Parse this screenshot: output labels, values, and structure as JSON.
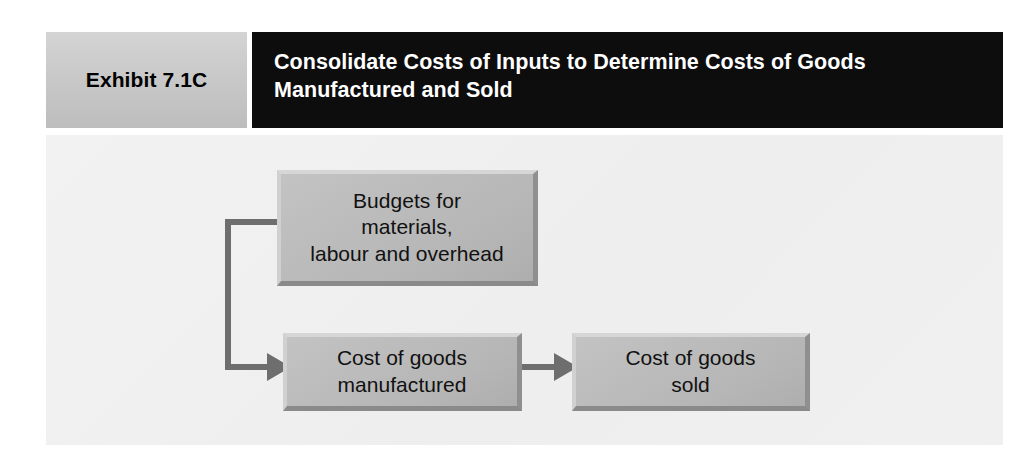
{
  "exhibit": {
    "label": "Exhibit 7.1C",
    "title": "Consolidate Costs of Inputs to Determine Costs of Goods Manufactured and Sold",
    "colors": {
      "label_background": "#c9c9c9",
      "title_background": "#0d0d0d",
      "title_text": "#ffffff",
      "panel_background": "#f0f0f0",
      "box_fill": "#bdbdbd",
      "box_highlight": "#d6d6d6",
      "box_shadow": "#8a8a8a",
      "connector": "#6e6e6e"
    }
  },
  "diagram": {
    "type": "flowchart",
    "nodes": [
      {
        "id": "budgets",
        "label": "Budgets for\nmaterials,\nlabour and overhead",
        "lines": [
          "Budgets for",
          "materials,",
          "labour and overhead"
        ]
      },
      {
        "id": "cogm",
        "label": "Cost of goods\nmanufactured",
        "lines": [
          "Cost of goods",
          "manufactured"
        ]
      },
      {
        "id": "cogs",
        "label": "Cost of goods\nsold",
        "lines": [
          "Cost of goods",
          "sold"
        ]
      }
    ],
    "edges": [
      {
        "from": "budgets",
        "to": "cogm",
        "style": "elbow-left",
        "arrowhead": true
      },
      {
        "from": "cogm",
        "to": "cogs",
        "style": "straight",
        "arrowhead": true
      }
    ]
  }
}
